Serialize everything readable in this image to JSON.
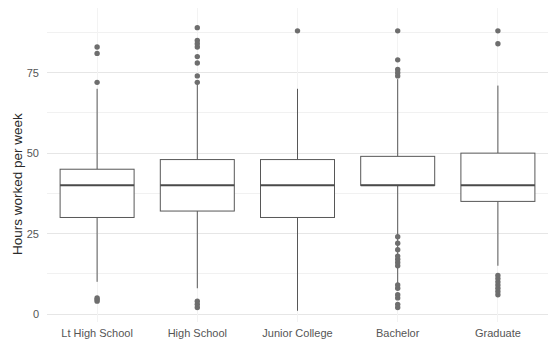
{
  "chart_data": {
    "type": "boxplot",
    "title": "",
    "xlabel": "",
    "ylabel": "Hours worked per week",
    "ylim": [
      -3,
      95
    ],
    "yticks": [
      0,
      25,
      50,
      75
    ],
    "ytick_labels": [
      "0",
      "25",
      "50",
      "75"
    ],
    "minor_yticks": [
      12.5,
      37.5,
      62.5,
      87.5
    ],
    "grid": true,
    "grid_axis": "y",
    "legend": "none",
    "categories": [
      "Lt High School",
      "High School",
      "Junior College",
      "Bachelor",
      "Graduate"
    ],
    "boxes": [
      {
        "category": "Lt High School",
        "whisker_low": 10,
        "q1": 30,
        "median": 40,
        "q3": 45,
        "whisker_high": 70,
        "outliers": [
          4,
          4.5,
          5,
          72,
          81,
          83
        ]
      },
      {
        "category": "High School",
        "whisker_low": 8,
        "q1": 32,
        "median": 40,
        "q3": 48,
        "whisker_high": 72,
        "outliers": [
          2,
          3,
          4,
          72,
          74,
          78,
          80,
          83,
          84,
          85,
          89
        ]
      },
      {
        "category": "Junior College",
        "whisker_low": 1,
        "q1": 30,
        "median": 40,
        "q3": 48,
        "whisker_high": 70,
        "outliers": [
          88
        ]
      },
      {
        "category": "Bachelor",
        "whisker_low": 9,
        "q1": 40,
        "median": 40,
        "q3": 49,
        "whisker_high": 73,
        "outliers": [
          2,
          3,
          5,
          6,
          8,
          9,
          15,
          16,
          17,
          18,
          20,
          22,
          24,
          74,
          75,
          76,
          79,
          88
        ]
      },
      {
        "category": "Graduate",
        "whisker_low": 15,
        "q1": 35,
        "median": 40,
        "q3": 50,
        "whisker_high": 71,
        "outliers": [
          6,
          7,
          8,
          9,
          10,
          11,
          12,
          84,
          88
        ]
      }
    ],
    "colors": {
      "box_stroke": "#575757",
      "box_fill": "#ffffff",
      "median": "#4a4a4a",
      "outlier": "#6e6e6e",
      "grid_major": "#e6e6e6",
      "grid_minor": "#f1f1f1",
      "text": "#555555",
      "axis_title": "#2b2b2b",
      "background": "#ffffff"
    }
  }
}
